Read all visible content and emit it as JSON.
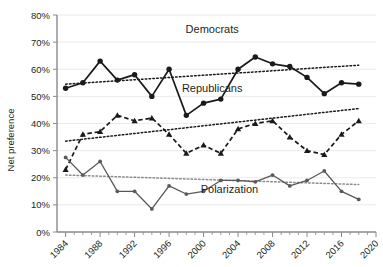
{
  "chart_data": {
    "type": "line",
    "title": "",
    "xlabel": "",
    "ylabel": "Net preference",
    "xlim": [
      1983,
      2020
    ],
    "ylim": [
      0,
      80
    ],
    "y_unit": "%",
    "ytick_labels": [
      "0%",
      "10%",
      "20%",
      "30%",
      "40%",
      "50%",
      "60%",
      "70%",
      "80%"
    ],
    "ytick_values": [
      0,
      10,
      20,
      30,
      40,
      50,
      60,
      70,
      80
    ],
    "xtick_labels": [
      "1984",
      "1988",
      "1992",
      "1996",
      "2000",
      "2004",
      "2008",
      "2012",
      "2016",
      "2020"
    ],
    "xtick_values": [
      1984,
      1988,
      1992,
      1996,
      2000,
      2004,
      2008,
      2012,
      2016,
      2020
    ],
    "x_minor_step": 1,
    "grid": true,
    "legend_position": "inline-annotations",
    "x": [
      1984,
      1986,
      1988,
      1990,
      1992,
      1994,
      1996,
      1998,
      2000,
      2002,
      2004,
      2006,
      2008,
      2010,
      2012,
      2014,
      2016,
      2018
    ],
    "series": [
      {
        "name": "Democrats",
        "marker": "circle",
        "line_style": "solid",
        "color": "#1a1a1a",
        "values": [
          53,
          55,
          63,
          56,
          58,
          50,
          60,
          43,
          47.5,
          49,
          60,
          64.5,
          62,
          61,
          57,
          51,
          55,
          54.5
        ]
      },
      {
        "name": "Republicans",
        "marker": "triangle",
        "line_style": "dashed",
        "color": "#1a1a1a",
        "values": [
          23,
          36,
          37,
          43,
          41,
          42,
          36,
          29,
          32,
          29,
          38,
          40,
          41,
          35,
          30,
          28.5,
          36,
          41
        ]
      },
      {
        "name": "Polarization",
        "marker": "dot",
        "line_style": "solid",
        "color": "#58595b",
        "values": [
          27.5,
          21,
          26,
          15,
          15,
          8.5,
          17,
          14,
          15,
          19,
          19,
          18.5,
          21,
          17,
          19,
          22.5,
          15,
          12
        ]
      }
    ],
    "trendlines": [
      {
        "name": "Democrats trend",
        "style": "dotted",
        "color": "#1a1a1a",
        "x0": 1984,
        "y0": 54.5,
        "x1": 2018,
        "y1": 61.5
      },
      {
        "name": "Republicans trend",
        "style": "dotted",
        "color": "#1a1a1a",
        "x0": 1984,
        "y0": 33.5,
        "x1": 2018,
        "y1": 45.5
      },
      {
        "name": "Polarization trend",
        "style": "dotted",
        "color": "#8c8c8c",
        "x0": 1984,
        "y0": 21,
        "x1": 2018,
        "y1": 17.5
      }
    ],
    "annotations": [
      {
        "text": "Democrats",
        "x": 2001,
        "y": 73.5
      },
      {
        "text": "Republicans",
        "x": 2001,
        "y": 51.5
      },
      {
        "text": "Polarization",
        "x": 2003,
        "y": 14.5
      }
    ]
  }
}
